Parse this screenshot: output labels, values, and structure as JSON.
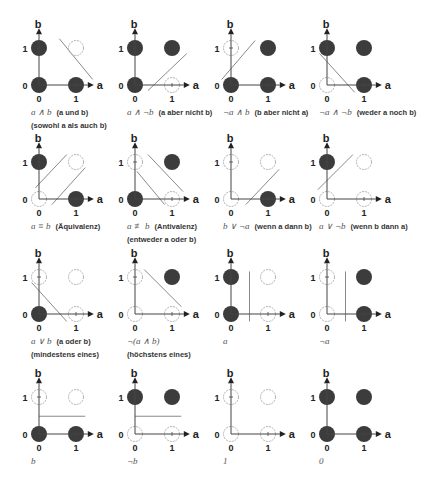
{
  "diagram": {
    "axes": {
      "x_label": "a",
      "y_label": "b",
      "ticks": [
        "0",
        "1"
      ]
    },
    "colors": {
      "filled": "#3c3c3c",
      "empty_stroke": "#b0b0b0",
      "axis": "#444444",
      "separator": "#8a8a8a"
    },
    "layout": {
      "column_origins_x": [
        39,
        135,
        231,
        327
      ],
      "row_origins_y": [
        85,
        199,
        314,
        434
      ],
      "unit": 37,
      "dot_radius": 8
    },
    "panels": [
      {
        "row": 0,
        "col": 0,
        "formula": "a ∧ b",
        "description": "(a und b)",
        "description2": "(sowohl a als auch b)",
        "points": {
          "p00": true,
          "p10": true,
          "p01": true,
          "p11": false
        },
        "lines": [
          [
            0.55,
            1.25,
            1.45,
            0.15
          ]
        ]
      },
      {
        "row": 0,
        "col": 1,
        "formula": "a ∧ ¬b",
        "description": "(a aber nicht b)",
        "description2": "",
        "points": {
          "p00": true,
          "p10": false,
          "p01": true,
          "p11": true
        },
        "lines": [
          [
            0.35,
            -0.15,
            1.4,
            0.85
          ]
        ]
      },
      {
        "row": 0,
        "col": 2,
        "formula": "¬a ∧ b",
        "description": "(b aber nicht a)",
        "description2": "",
        "points": {
          "p00": true,
          "p10": true,
          "p01": false,
          "p11": true
        },
        "lines": [
          [
            -0.25,
            0.15,
            0.65,
            1.2
          ]
        ]
      },
      {
        "row": 0,
        "col": 3,
        "formula": "¬a ∧ ¬b",
        "description": "(weder a noch b)",
        "description2": "",
        "points": {
          "p00": false,
          "p10": true,
          "p01": true,
          "p11": true
        },
        "lines": [
          [
            -0.2,
            0.85,
            0.75,
            -0.2
          ]
        ]
      },
      {
        "row": 1,
        "col": 0,
        "formula": "a ≡ b",
        "description": "(Äquivalenz)",
        "description2": "",
        "points": {
          "p00": false,
          "p10": true,
          "p01": true,
          "p11": false
        },
        "lines": [
          [
            -0.1,
            0.3,
            0.75,
            1.2
          ],
          [
            0.35,
            -0.15,
            1.25,
            0.85
          ]
        ]
      },
      {
        "row": 1,
        "col": 1,
        "formula": "a ≢ b",
        "description": "(Antivalenz)",
        "description2": "(entweder a oder b)",
        "points": {
          "p00": true,
          "p10": false,
          "p01": false,
          "p11": true
        },
        "lines": [
          [
            0.05,
            0.75,
            0.8,
            -0.15
          ],
          [
            0.35,
            1.2,
            1.3,
            0.2
          ]
        ]
      },
      {
        "row": 1,
        "col": 2,
        "formula": "b ∨ ¬a",
        "description": "(wenn a dann b)",
        "description2": "",
        "points": {
          "p00": false,
          "p10": true,
          "p01": false,
          "p11": false
        },
        "lines": [
          [
            0.4,
            -0.15,
            1.3,
            0.8
          ]
        ]
      },
      {
        "row": 1,
        "col": 3,
        "formula": "a ∨ ¬b",
        "description": "(wenn b dann a)",
        "description2": "",
        "points": {
          "p00": false,
          "p10": false,
          "p01": true,
          "p11": false
        },
        "lines": [
          [
            -0.25,
            0.25,
            0.7,
            1.2
          ]
        ]
      },
      {
        "row": 2,
        "col": 0,
        "formula": "a ∨ b",
        "description": "(a oder b)",
        "description2": "(mindestens eines)",
        "points": {
          "p00": true,
          "p10": false,
          "p01": false,
          "p11": false
        },
        "lines": [
          [
            -0.2,
            0.85,
            0.75,
            -0.2
          ]
        ]
      },
      {
        "row": 2,
        "col": 1,
        "formula": "¬(a ∧ b)",
        "description": "",
        "description2": "(höchstens eines)",
        "points": {
          "p00": false,
          "p10": false,
          "p01": false,
          "p11": true
        },
        "lines": [
          [
            0.25,
            1.2,
            1.25,
            0.2
          ]
        ]
      },
      {
        "row": 2,
        "col": 2,
        "formula": "a",
        "description": "",
        "description2": "",
        "points": {
          "p00": true,
          "p10": false,
          "p01": true,
          "p11": false
        },
        "lines": [
          [
            0.5,
            1.15,
            0.5,
            -0.2
          ]
        ]
      },
      {
        "row": 2,
        "col": 3,
        "formula": "¬a",
        "description": "",
        "description2": "",
        "points": {
          "p00": false,
          "p10": true,
          "p01": false,
          "p11": true
        },
        "lines": [
          [
            0.5,
            1.15,
            0.5,
            -0.2
          ]
        ]
      },
      {
        "row": 3,
        "col": 0,
        "formula": "b",
        "description": "",
        "description2": "",
        "points": {
          "p00": true,
          "p10": true,
          "p01": false,
          "p11": false
        },
        "lines": [
          [
            0.0,
            0.48,
            1.25,
            0.48
          ]
        ]
      },
      {
        "row": 3,
        "col": 1,
        "formula": "¬b",
        "description": "",
        "description2": "",
        "points": {
          "p00": false,
          "p10": false,
          "p01": true,
          "p11": true
        },
        "lines": [
          [
            0.0,
            0.48,
            1.25,
            0.48
          ]
        ]
      },
      {
        "row": 3,
        "col": 2,
        "formula": "1",
        "description": "",
        "description2": "",
        "points": {
          "p00": false,
          "p10": false,
          "p01": false,
          "p11": false
        },
        "lines": []
      },
      {
        "row": 3,
        "col": 3,
        "formula": "0",
        "description": "",
        "description2": "",
        "points": {
          "p00": true,
          "p10": true,
          "p01": true,
          "p11": true
        },
        "lines": []
      }
    ]
  }
}
